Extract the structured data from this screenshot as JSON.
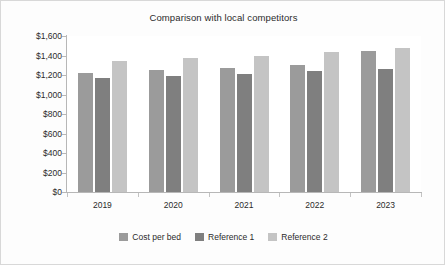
{
  "chart_data": {
    "type": "bar",
    "title": "Comparison with local competitors",
    "xlabel": "",
    "ylabel": "",
    "categories": [
      "2019",
      "2020",
      "2021",
      "2022",
      "2023"
    ],
    "series": [
      {
        "name": "Cost per bed",
        "color": "#9b9b9b",
        "values": [
          1225,
          1250,
          1270,
          1305,
          1450
        ]
      },
      {
        "name": "Reference 1",
        "color": "#7f7f7f",
        "values": [
          1170,
          1190,
          1210,
          1240,
          1265
        ]
      },
      {
        "name": "Reference 2",
        "color": "#c4c4c4",
        "values": [
          1345,
          1370,
          1395,
          1435,
          1480
        ]
      }
    ],
    "ylim": [
      0,
      1600
    ],
    "ytick_values": [
      0,
      200,
      400,
      600,
      800,
      1000,
      1200,
      1400,
      1600
    ],
    "ytick_labels": [
      "$0",
      "$200",
      "$400",
      "$600",
      "$800",
      "$1,000",
      "$1,200",
      "$1,400",
      "$1,600"
    ],
    "grid": false,
    "legend_position": "bottom"
  },
  "axis": {
    "line_color": "#b7b7b7",
    "text_color": "#2b2b2b"
  },
  "frame": {
    "background": "#fdfdfd",
    "border_color": "#d8d8d8"
  }
}
